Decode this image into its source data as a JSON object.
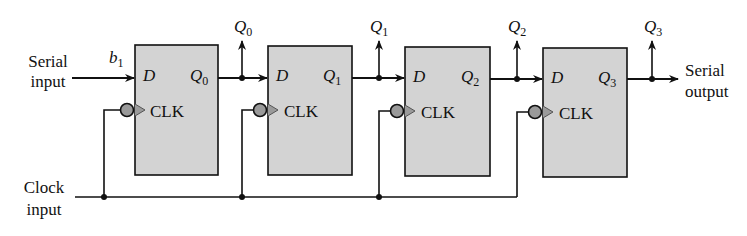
{
  "diagram": {
    "inputs": {
      "serial_line1": "Serial",
      "serial_line2": "input",
      "clock_line1": "Clock",
      "clock_line2": "input",
      "first_bit": "b",
      "first_bit_sub": "1"
    },
    "outputs": {
      "serial_line1": "Serial",
      "serial_line2": "output"
    },
    "flipflops": [
      {
        "d": "D",
        "q": "Q",
        "q_sub": "0",
        "clk": "CLK",
        "tap": "Q",
        "tap_sub": "0"
      },
      {
        "d": "D",
        "q": "Q",
        "q_sub": "1",
        "clk": "CLK",
        "tap": "Q",
        "tap_sub": "1"
      },
      {
        "d": "D",
        "q": "Q",
        "q_sub": "2",
        "clk": "CLK",
        "tap": "Q",
        "tap_sub": "2"
      },
      {
        "d": "D",
        "q": "Q",
        "q_sub": "3",
        "clk": "CLK",
        "tap": "Q",
        "tap_sub": "3"
      }
    ],
    "colors": {
      "box_fill": "#d3d3d3",
      "bubble_fill": "#9a9a9a",
      "line": "#111111"
    }
  }
}
